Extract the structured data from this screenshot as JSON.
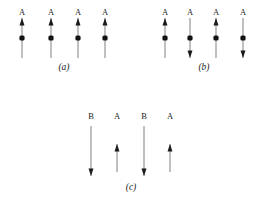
{
  "figure": {
    "width": 262,
    "height": 210,
    "background_color": "#ffffff",
    "line_color": "#8c8c8c",
    "arrowhead_color": "#1b1b1b",
    "dot_color": "#111111",
    "label_color": "#1b1b1b"
  },
  "panels": [
    {
      "id": "panel-a",
      "caption": "(a)",
      "caption_x": 49,
      "caption_y": 62,
      "sites": [
        {
          "label": "A",
          "x": 22,
          "label_y": 8,
          "arrow": {
            "direction": "up",
            "top": 18,
            "bottom": 58
          },
          "dot_y": 38,
          "has_dot": true
        },
        {
          "label": "A",
          "x": 51,
          "label_y": 8,
          "arrow": {
            "direction": "up",
            "top": 18,
            "bottom": 58
          },
          "dot_y": 38,
          "has_dot": true
        },
        {
          "label": "A",
          "x": 78,
          "label_y": 8,
          "arrow": {
            "direction": "up",
            "top": 18,
            "bottom": 58
          },
          "dot_y": 38,
          "has_dot": true
        },
        {
          "label": "A",
          "x": 105,
          "label_y": 8,
          "arrow": {
            "direction": "up",
            "top": 18,
            "bottom": 58
          },
          "dot_y": 38,
          "has_dot": true
        }
      ]
    },
    {
      "id": "panel-b",
      "caption": "(b)",
      "caption_x": 189,
      "caption_y": 62,
      "sites": [
        {
          "label": "A",
          "x": 165,
          "label_y": 8,
          "arrow": {
            "direction": "up",
            "top": 18,
            "bottom": 58
          },
          "dot_y": 38,
          "has_dot": true
        },
        {
          "label": "A",
          "x": 190,
          "label_y": 8,
          "arrow": {
            "direction": "down",
            "top": 18,
            "bottom": 58
          },
          "dot_y": 38,
          "has_dot": true
        },
        {
          "label": "A",
          "x": 216,
          "label_y": 8,
          "arrow": {
            "direction": "up",
            "top": 18,
            "bottom": 58
          },
          "dot_y": 38,
          "has_dot": true
        },
        {
          "label": "A",
          "x": 243,
          "label_y": 8,
          "arrow": {
            "direction": "down",
            "top": 18,
            "bottom": 58
          },
          "dot_y": 38,
          "has_dot": true
        }
      ]
    },
    {
      "id": "panel-c",
      "caption": "(c)",
      "caption_x": 116,
      "caption_y": 182,
      "sites": [
        {
          "label": "B",
          "x": 91,
          "label_y": 112,
          "arrow": {
            "direction": "down",
            "top": 126,
            "bottom": 176
          },
          "dot_y": 0,
          "has_dot": false
        },
        {
          "label": "A",
          "x": 117,
          "label_y": 112,
          "arrow": {
            "direction": "up",
            "top": 144,
            "bottom": 172
          },
          "dot_y": 0,
          "has_dot": false
        },
        {
          "label": "B",
          "x": 144,
          "label_y": 112,
          "arrow": {
            "direction": "down",
            "top": 126,
            "bottom": 176
          },
          "dot_y": 0,
          "has_dot": false
        },
        {
          "label": "A",
          "x": 170,
          "label_y": 112,
          "arrow": {
            "direction": "up",
            "top": 144,
            "bottom": 172
          },
          "dot_y": 0,
          "has_dot": false
        }
      ]
    }
  ]
}
